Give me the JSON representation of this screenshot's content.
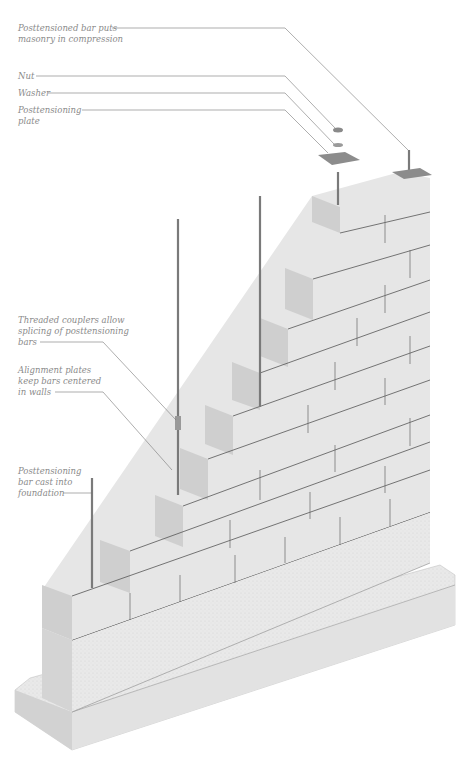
{
  "figure": {
    "colors": {
      "block": "#e4e4e4",
      "block_side": "#c8c8c8",
      "joint": "#555555",
      "bar": "#7a7a7a",
      "concrete": "#ececec",
      "leader": "#777777",
      "label": "#8a8a8a"
    }
  },
  "callouts": [
    {
      "id": "bar-compression",
      "text": "Posttensioned bar puts\nmasonry in compression"
    },
    {
      "id": "nut",
      "text": "Nut"
    },
    {
      "id": "washer",
      "text": "Washer"
    },
    {
      "id": "plate",
      "text": "Posttensioning\nplate"
    },
    {
      "id": "couplers",
      "text": "Threaded couplers allow\nsplicing of posttensioning\nbars"
    },
    {
      "id": "alignment",
      "text": "Alignment plates\nkeep bars centered\nin walls"
    },
    {
      "id": "foundation-bar",
      "text": "Posttensioning\nbar cast into\nfoundation"
    }
  ]
}
